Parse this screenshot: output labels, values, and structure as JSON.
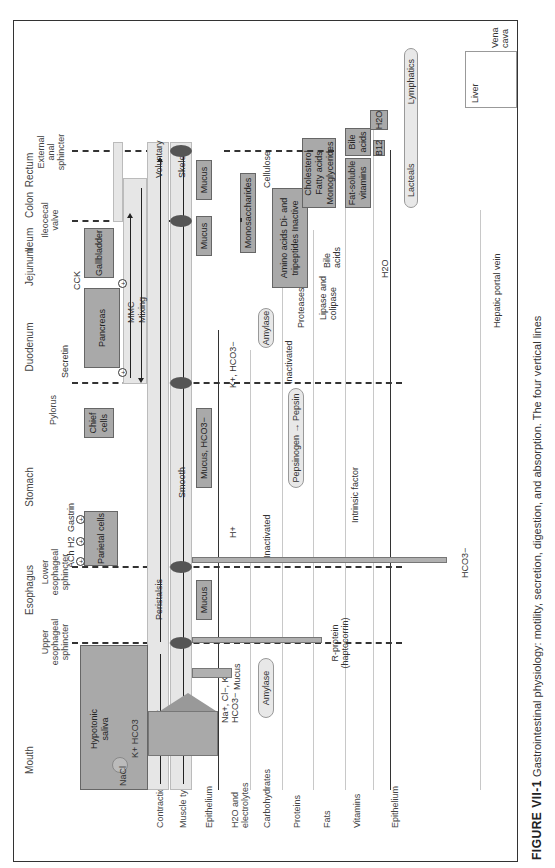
{
  "figure": {
    "label": "FIGURE VII-1",
    "caption": "Gastrointestinal physiology: motility, secretion, digestion, and absorption. The four vertical lines"
  },
  "regions": [
    "Mouth",
    "Esophagus",
    "Stomach",
    "Duodenum",
    "Jejunum",
    "Ileum",
    "Colon",
    "Rectum"
  ],
  "sphincters": {
    "upper_esophageal": "Upper esophageal sphincter",
    "lower_esophageal": "Lower esophageal sphincter",
    "pylorus": "Pylorus",
    "ileocecal": "Ileocecal valve",
    "external_anal": "External anal sphincter"
  },
  "rows": [
    "Contraction",
    "Muscle type",
    "Epithelium",
    "H2O and electrolytes",
    "Carbohydrates",
    "Proteins",
    "Fats",
    "Vitamins",
    "Epithelium"
  ],
  "motility": {
    "voluntary_mouth": "Voluntary",
    "peristalsis": "Peristalsis",
    "mmc": "MMC",
    "mixing": "Mixing",
    "voluntary_rectum": "Voluntary",
    "skeletal_upper": "Skeletal",
    "smooth": "Smooth",
    "skeletal_lower": "Skeletal"
  },
  "secretory_cells": {
    "saliva": "Hypotonic saliva",
    "parietal": "Parietal cells",
    "chief": "Chief cells",
    "pancreas": "Pancreas",
    "gallbladder": "Gallbladder",
    "mucus_esophagus": "Mucus",
    "mucus_stomach": "Mucus, HCO3−",
    "mucus_ileum": "Mucus",
    "mucus_colon": "Mucus"
  },
  "stimuli": {
    "ach": "ACh",
    "h2": "H2",
    "gastrin": "Gastrin",
    "secretin": "Secretin",
    "cck": "CCK",
    "plus": "+"
  },
  "ions": {
    "nacl": "NaCl",
    "k_hco3": "K+ HCO3",
    "saliva_electrolytes": "Na+, Cl−, K+, HCO3−",
    "saliva_mucus": "Mucus",
    "h_plus": "H+",
    "k_hco3_duod": "K+, HCO3−",
    "h2o": "H2O"
  },
  "digestion": {
    "amylase_saliva": "Amylase",
    "inactivated_amylase": "Inactivated",
    "amylase_pancreas": "Amylase",
    "pepsinogen": "Pepsinogen",
    "pepsin": "Pepsin",
    "inactivated_pepsin": "Inactivated",
    "proteases": "Proteases",
    "lipase": "Lipase and colipase",
    "bile_acids_secreted": "Bile acids",
    "intrinsic_factor": "Intrinsic factor",
    "r_protein": "R-protein (haptocorrin)",
    "cellulose": "Cellulose"
  },
  "absorption": {
    "monosaccharides": "Monosaccharides",
    "amino_acids": "Amino acids Di- and tripeptides Inactive",
    "lipids": "Cholesterol Fatty acids Monoglycerides",
    "fat_soluble": "Fat-soluble vitamins",
    "bile_acids": "Bile acids",
    "b12": "B12",
    "h2o": "H2O",
    "hco3": "HCO3−"
  },
  "circulation": {
    "lacteals": "Lacteals",
    "lymphatics": "Lymphatics",
    "hepatic_portal": "Hepatic portal vein",
    "liver": "Liver",
    "vena_cava": "Vena cava"
  }
}
